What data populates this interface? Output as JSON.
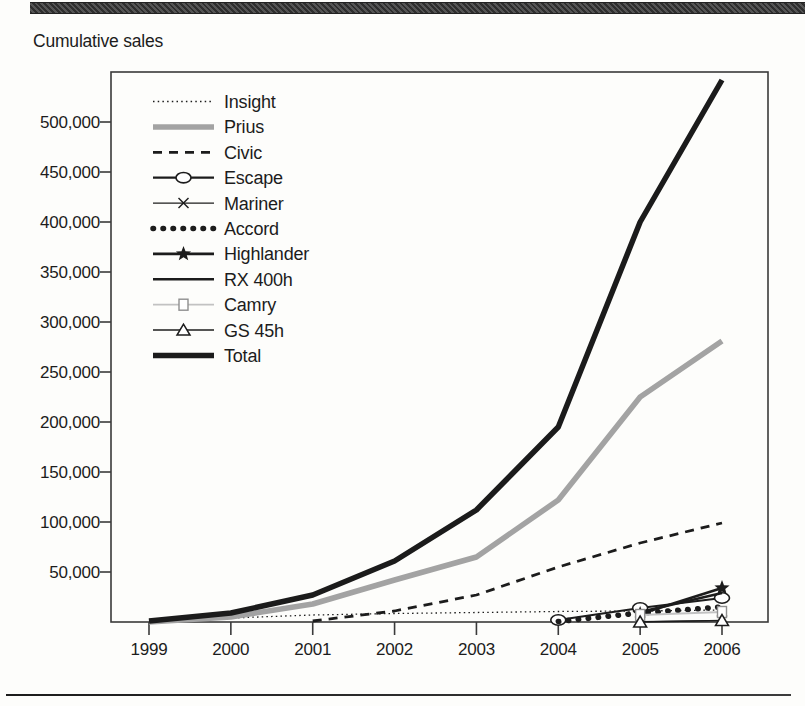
{
  "page": {
    "title": "Cumulative sales"
  },
  "colors": {
    "ink": "#1c1c1c",
    "prius_gray": "#a3a3a3",
    "camry_gray": "#c2c2c2",
    "frame": "#3a3a3a"
  },
  "chart_data": {
    "type": "line",
    "title": "Cumulative sales",
    "xlabel": "",
    "ylabel": "",
    "x": [
      1999,
      2000,
      2001,
      2002,
      2003,
      2004,
      2005,
      2006
    ],
    "ylim": [
      0,
      550000
    ],
    "ytick_step": 50000,
    "yticks": [
      50000,
      100000,
      150000,
      200000,
      250000,
      300000,
      350000,
      400000,
      450000,
      500000
    ],
    "grid": false,
    "legend_position": "top-left",
    "series": [
      {
        "name": "Insight",
        "values": [
          0,
          4000,
          7000,
          8500,
          9500,
          10500,
          11000,
          12000
        ],
        "color": "#1c1c1c",
        "width": 1.3,
        "dash": "1.5 3.2",
        "marker": "none"
      },
      {
        "name": "Prius",
        "values": [
          0,
          5000,
          18000,
          42000,
          65000,
          122000,
          225000,
          281000
        ],
        "color": "#a3a3a3",
        "width": 5.5,
        "dash": "",
        "marker": "none"
      },
      {
        "name": "Civic",
        "values": [
          null,
          null,
          1000,
          11000,
          27000,
          55000,
          79000,
          99000
        ],
        "color": "#1c1c1c",
        "width": 2.8,
        "dash": "9 7",
        "marker": "none"
      },
      {
        "name": "Escape",
        "values": [
          null,
          null,
          null,
          null,
          null,
          2000,
          14000,
          24000
        ],
        "color": "#1c1c1c",
        "width": 2.2,
        "dash": "",
        "marker": "circle-open"
      },
      {
        "name": "Mariner",
        "values": [
          null,
          null,
          null,
          null,
          null,
          null,
          500,
          1500
        ],
        "color": "#1c1c1c",
        "width": 1.2,
        "dash": "",
        "marker": "x"
      },
      {
        "name": "Accord",
        "values": [
          null,
          null,
          null,
          null,
          null,
          500,
          9000,
          15000
        ],
        "color": "#1c1c1c",
        "width": 5.5,
        "dash": "0.5 9.5",
        "marker": "none",
        "linecap": "round"
      },
      {
        "name": "Highlander",
        "values": [
          null,
          null,
          null,
          null,
          null,
          null,
          8000,
          34000
        ],
        "color": "#1c1c1c",
        "width": 2.8,
        "dash": "",
        "marker": "star"
      },
      {
        "name": "RX 400h",
        "values": [
          null,
          null,
          null,
          null,
          null,
          null,
          10000,
          29000
        ],
        "color": "#1c1c1c",
        "width": 2.5,
        "dash": "",
        "marker": "none"
      },
      {
        "name": "Camry",
        "values": [
          null,
          null,
          null,
          null,
          null,
          null,
          7000,
          10000
        ],
        "color": "#c2c2c2",
        "width": 1.8,
        "dash": "",
        "marker": "square-open"
      },
      {
        "name": "GS 45h",
        "values": [
          null,
          null,
          null,
          null,
          null,
          null,
          0,
          1500
        ],
        "color": "#1c1c1c",
        "width": 1.5,
        "dash": "",
        "marker": "triangle-open"
      },
      {
        "name": "Total",
        "values": [
          1000,
          9000,
          27000,
          61000,
          112000,
          195000,
          400000,
          542000
        ],
        "color": "#1b1b1b",
        "width": 5.5,
        "dash": "",
        "marker": "none"
      }
    ]
  }
}
